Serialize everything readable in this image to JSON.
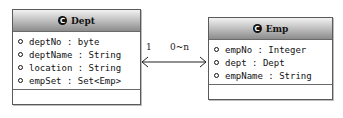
{
  "classes": [
    {
      "name": "Dept",
      "icon": "class-icon",
      "icon_glyph": "C",
      "attributes": [
        "deptNo : byte",
        "deptName : String",
        "location : String",
        "empSet : Set<Emp>"
      ]
    },
    {
      "name": "Emp",
      "icon": "class-icon",
      "icon_glyph": "C",
      "attributes": [
        "empNo : Integer",
        "dept : Dept",
        "empName : String"
      ]
    }
  ],
  "association": {
    "source_multiplicity": "1",
    "target_multiplicity": "0~n",
    "navigability": "bidirectional"
  },
  "colors": {
    "header_gradient_top": "#f2f2f2",
    "header_gradient_bottom": "#8c8c8c",
    "border": "#5a5a5a"
  }
}
